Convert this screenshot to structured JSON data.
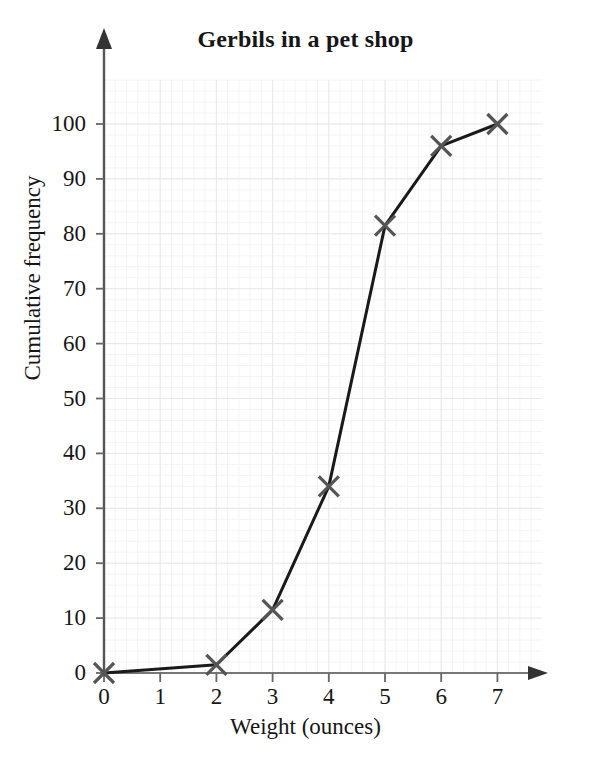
{
  "chart_data": {
    "type": "line",
    "title": "Gerbils in a pet shop",
    "xlabel": "Weight (ounces)",
    "ylabel": "Cumulative frequency",
    "x": [
      0,
      2,
      3,
      4,
      5,
      6,
      7
    ],
    "values": [
      0,
      1.5,
      11.5,
      34,
      81.5,
      96,
      100
    ],
    "points": [
      {
        "x": 0,
        "y": 0
      },
      {
        "x": 2,
        "y": 1.5
      },
      {
        "x": 3,
        "y": 11.5
      },
      {
        "x": 4,
        "y": 34
      },
      {
        "x": 5,
        "y": 81.5
      },
      {
        "x": 6,
        "y": 96
      },
      {
        "x": 7,
        "y": 100
      }
    ],
    "xlim": [
      0,
      7.8
    ],
    "ylim": [
      0,
      108
    ],
    "xticks": [
      0,
      1,
      2,
      3,
      4,
      5,
      6,
      7
    ],
    "xtick_labels": [
      "0",
      "1",
      "2",
      "3",
      "4",
      "5",
      "6",
      "7"
    ],
    "yticks": [
      0,
      10,
      20,
      30,
      40,
      50,
      60,
      70,
      80,
      90,
      100
    ],
    "ytick_labels": [
      "0",
      "10",
      "20",
      "30",
      "40",
      "50",
      "60",
      "70",
      "80",
      "90",
      "100"
    ],
    "grid": true,
    "grid_minor": true,
    "legend": false,
    "marker": "x-cross",
    "marker_color": "#555555",
    "line_color": "#1a1a1a",
    "grid_color": "#e9e9ec",
    "grid_minor_color": "#f4f4f6",
    "axis_color": "#777777",
    "axis_arrows": true
  }
}
